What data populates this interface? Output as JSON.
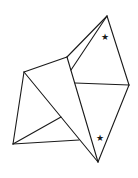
{
  "diagram": {
    "title": "",
    "stroke_color": "#1a1a1a",
    "background": "#ffffff",
    "vertices": {
      "top_apex": [
        107,
        16
      ],
      "right": [
        129,
        85
      ],
      "bottom_apex": [
        98,
        162
      ],
      "upper_mid": [
        67,
        57
      ],
      "inner_upper": [
        71,
        70
      ],
      "mid_left": [
        75,
        83
      ],
      "left_upper": [
        24,
        72
      ],
      "bottom_left": [
        13,
        144
      ],
      "inner_low": [
        61,
        117
      ],
      "bottom_mid": [
        79,
        140
      ]
    },
    "edges": [
      [
        "top_apex",
        "right"
      ],
      [
        "right",
        "bottom_apex"
      ],
      [
        "top_apex",
        "upper_mid"
      ],
      [
        "top_apex",
        "inner_upper"
      ],
      [
        "upper_mid",
        "bottom_apex"
      ],
      [
        "mid_left",
        "right"
      ],
      [
        "upper_mid",
        "left_upper"
      ],
      [
        "left_upper",
        "bottom_left"
      ],
      [
        "left_upper",
        "bottom_apex"
      ],
      [
        "bottom_left",
        "inner_low"
      ],
      [
        "bottom_left",
        "bottom_mid"
      ]
    ],
    "markers": [
      {
        "symbol": "★",
        "x": 105,
        "y": 37,
        "label": "star-upper"
      },
      {
        "symbol": "★",
        "x": 100,
        "y": 138,
        "label": "star-lower"
      }
    ]
  }
}
